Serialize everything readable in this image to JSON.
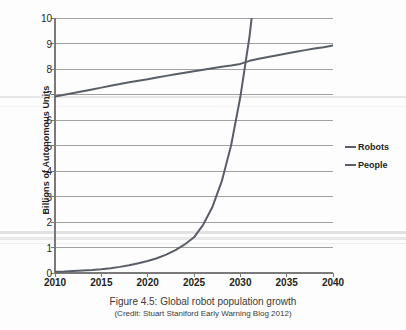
{
  "chart_data": {
    "type": "line",
    "title": "",
    "xlabel": "",
    "ylabel": "Billions of Autonomous Units",
    "xlim": [
      2010,
      2040
    ],
    "ylim": [
      0,
      10
    ],
    "grid": true,
    "legend_position": "right",
    "xticks": [
      "2010",
      "2015",
      "2020",
      "2025",
      "2030",
      "2035",
      "2040"
    ],
    "yticks": [
      "0",
      "1",
      "2",
      "3",
      "4",
      "5",
      "6",
      "7",
      "8",
      "9",
      "10"
    ],
    "x": [
      2010,
      2011,
      2012,
      2013,
      2014,
      2015,
      2016,
      2017,
      2018,
      2019,
      2020,
      2021,
      2022,
      2023,
      2024,
      2025,
      2026,
      2027,
      2028,
      2029,
      2030,
      2031,
      2032,
      2033,
      2034,
      2035,
      2036,
      2037,
      2038,
      2039,
      2040
    ],
    "series": [
      {
        "name": "Robots",
        "color": "#595e68",
        "values": [
          0.05,
          0.06,
          0.08,
          0.1,
          0.12,
          0.15,
          0.19,
          0.24,
          0.3,
          0.38,
          0.47,
          0.58,
          0.72,
          0.9,
          1.12,
          1.4,
          1.9,
          2.6,
          3.6,
          5.0,
          6.9,
          9.3,
          12.5,
          17.0,
          23.0,
          31.0,
          42.0,
          57.0,
          77.0,
          104.0,
          140.0
        ]
      },
      {
        "name": "People",
        "color": "#595e68",
        "values": [
          6.92,
          6.99,
          7.06,
          7.13,
          7.2,
          7.27,
          7.34,
          7.41,
          7.48,
          7.54,
          7.6,
          7.67,
          7.73,
          7.79,
          7.85,
          7.91,
          7.97,
          8.03,
          8.09,
          8.14,
          8.2,
          8.32,
          8.4,
          8.47,
          8.54,
          8.61,
          8.68,
          8.74,
          8.8,
          8.85,
          8.92
        ]
      }
    ],
    "annotations": []
  },
  "legend": {
    "items": [
      {
        "label": "Robots",
        "color": "#595e68"
      },
      {
        "label": "People",
        "color": "#595e68"
      }
    ]
  },
  "caption": {
    "line1": "Figure 4.5: Global robot population growth",
    "line2": "(Credit: Stuart Staniford Early Warning Blog 2012)"
  },
  "colors": {
    "axis": "#7a7a7a",
    "grid": "#8a8a8a",
    "line": "#595e68",
    "text": "#231f20",
    "background": "#fdfdfd"
  }
}
